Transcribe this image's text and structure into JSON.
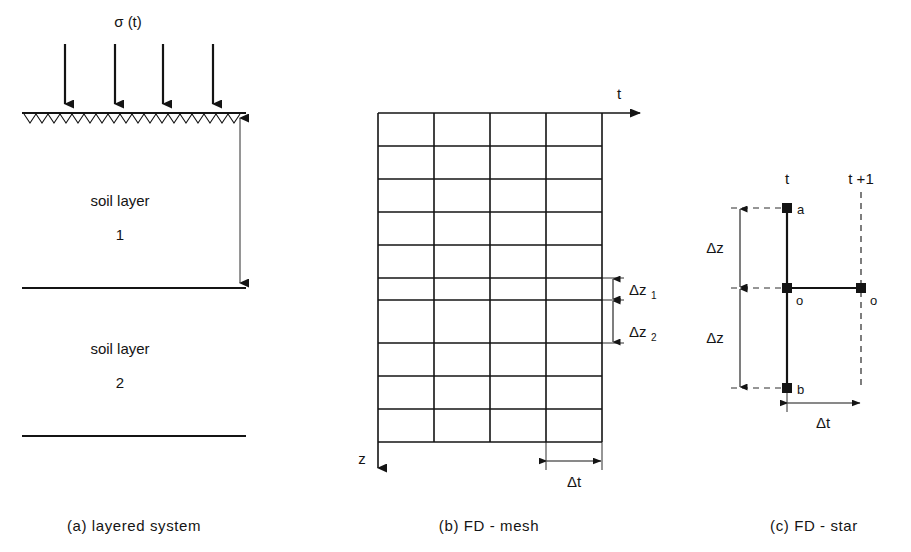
{
  "figure": {
    "panels": [
      {
        "id": "a",
        "caption": "(a) layered system",
        "load_label": "σ (t)",
        "layer1_name": "soil layer",
        "layer1_index": "1",
        "layer2_name": "soil layer",
        "layer2_index": "2",
        "arrow_count": 4
      },
      {
        "id": "b",
        "caption": "(b) FD - mesh",
        "axis_t": "t",
        "axis_z": "z",
        "dz1_label": "Δz",
        "dz1_sub": "1",
        "dz2_label": "Δz",
        "dz2_sub": "2",
        "dt_label": "Δt",
        "columns": 4,
        "rows": 10
      },
      {
        "id": "c",
        "caption": "(c) FD - star",
        "col_t": "t",
        "col_t_plus_1": "t +1",
        "node_a": "a",
        "node_o_center": "o",
        "node_o_right": "o",
        "node_b": "b",
        "dz_upper": "Δz",
        "dz_lower": "Δz",
        "dt_label": "Δt"
      }
    ],
    "colors": {
      "ink": "#141414",
      "background": "#ffffff"
    }
  }
}
